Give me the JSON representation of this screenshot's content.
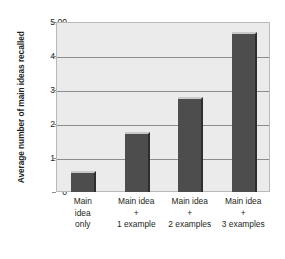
{
  "chart_data": {
    "type": "bar",
    "title": "",
    "xlabel": "",
    "ylabel": "Average number of main ideas recalled",
    "categories": [
      "Main idea only",
      "Main idea + 1 example",
      "Main idea + 2 examples",
      "Main idea + 3 examples"
    ],
    "category_lines": [
      [
        "Main",
        "idea",
        "only"
      ],
      [
        "Main idea",
        "+",
        "1 example"
      ],
      [
        "Main idea",
        "+",
        "2 examples"
      ],
      [
        "Main idea",
        "+",
        "3 examples"
      ]
    ],
    "values": [
      0.65,
      1.8,
      2.82,
      4.75
    ],
    "ylim": [
      0,
      5
    ],
    "yticks": [
      0,
      1,
      2,
      3,
      4,
      5
    ],
    "ytick_labels": [
      "0",
      "1.00",
      "2.00",
      "3.00",
      "4.00",
      "5.00"
    ],
    "grid": true,
    "legend": false,
    "bar_color": "#4d4d4d",
    "plot_background": "#ebebeb",
    "gridline_color": "#8d8d8d",
    "page_background": "#ffffff"
  }
}
